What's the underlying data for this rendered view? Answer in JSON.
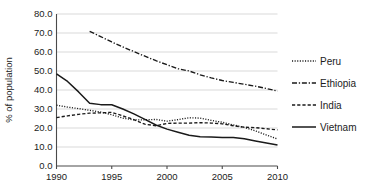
{
  "chart_data": {
    "type": "line",
    "title": "",
    "xlabel": "",
    "ylabel": "% of population",
    "xlim": [
      1990,
      2010
    ],
    "ylim": [
      0.0,
      80.0
    ],
    "grid": true,
    "legend_position": "right",
    "x_ticks": [
      "1990",
      "1995",
      "2000",
      "2005",
      "2010"
    ],
    "x_tick_values": [
      1990,
      1995,
      2000,
      2005,
      2010
    ],
    "y_ticks": [
      "0.0",
      "10.0",
      "20.0",
      "30.0",
      "40.0",
      "50.0",
      "60.0",
      "70.0",
      "80.0"
    ],
    "y_tick_values": [
      0.0,
      10.0,
      20.0,
      30.0,
      40.0,
      50.0,
      60.0,
      70.0,
      80.0
    ],
    "series": [
      {
        "name": "Peru",
        "style": "dotted",
        "x": [
          1990,
          1991,
          1992,
          1993,
          1994,
          1995,
          1996,
          1997,
          1998,
          1999,
          2000,
          2001,
          2002,
          2003,
          2004,
          2005,
          2006,
          2007,
          2008,
          2009,
          2010
        ],
        "values": [
          32.0,
          31.0,
          30.2,
          29.3,
          28.4,
          27.0,
          25.2,
          24.3,
          24.3,
          24.5,
          23.6,
          24.4,
          25.4,
          25.2,
          24.0,
          23.0,
          21.6,
          20.3,
          18.5,
          16.3,
          14.2
        ]
      },
      {
        "name": "Ethiopia",
        "style": "dash-dot",
        "x": [
          1993,
          1994,
          1995,
          1996,
          1997,
          1998,
          1999,
          2000,
          2001,
          2002,
          2003,
          2004,
          2005,
          2006,
          2007,
          2008,
          2009,
          2010
        ],
        "values": [
          70.9,
          68.1,
          65.3,
          62.7,
          60.2,
          57.8,
          55.4,
          53.3,
          51.2,
          50.0,
          48.0,
          46.4,
          45.0,
          44.0,
          43.0,
          42.0,
          40.8,
          39.4
        ]
      },
      {
        "name": "India",
        "style": "dashed",
        "x": [
          1990,
          1991,
          1992,
          1993,
          1994,
          1995,
          1996,
          1997,
          1998,
          1999,
          2000,
          2001,
          2002,
          2003,
          2004,
          2005,
          2006,
          2007,
          2008,
          2009,
          2010
        ],
        "values": [
          25.5,
          26.4,
          27.2,
          27.8,
          28.0,
          28.2,
          26.4,
          24.4,
          22.0,
          21.2,
          22.4,
          22.6,
          22.6,
          22.8,
          22.6,
          22.2,
          21.2,
          20.4,
          20.2,
          19.6,
          19.0
        ]
      },
      {
        "name": "Vietnam",
        "style": "solid",
        "x": [
          1990,
          1991,
          1992,
          1993,
          1994,
          1995,
          1996,
          1997,
          1998,
          1999,
          2000,
          2001,
          2002,
          2003,
          2004,
          2005,
          2006,
          2007,
          2008,
          2009,
          2010
        ],
        "values": [
          48.5,
          44.5,
          39.0,
          33.0,
          32.3,
          32.2,
          30.0,
          27.4,
          24.5,
          21.6,
          19.4,
          17.8,
          16.2,
          15.4,
          15.2,
          15.0,
          15.0,
          14.3,
          13.2,
          12.1,
          11.0
        ]
      }
    ],
    "legend": [
      {
        "label": "Peru",
        "style": "dotted"
      },
      {
        "label": "Ethiopia",
        "style": "dash-dot"
      },
      {
        "label": "India",
        "style": "dashed"
      },
      {
        "label": "Vietnam",
        "style": "solid"
      }
    ]
  }
}
